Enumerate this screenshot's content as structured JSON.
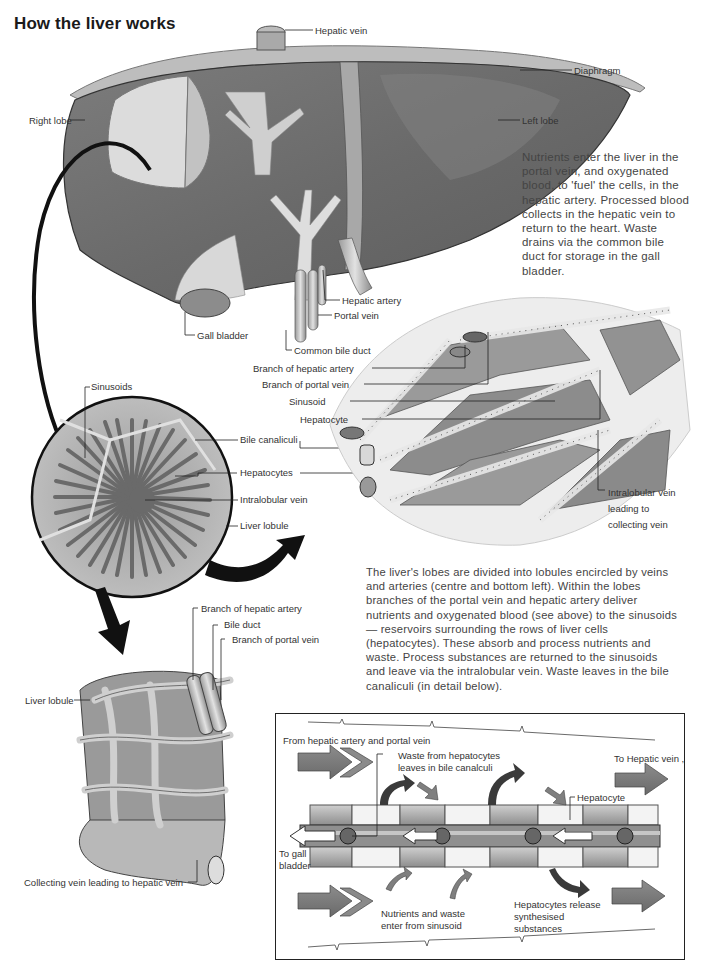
{
  "title": "How the liver works",
  "colors": {
    "liver_dark": "#6b6b6b",
    "liver_mid": "#8a8a8a",
    "liver_light": "#c8c8c8",
    "vessel_light": "#d9d9d9",
    "arrow_black": "#111111",
    "flow_arrow": "#7a7a7a",
    "text": "#333333"
  },
  "liver_labels": {
    "hepatic_vein": "Hepatic vein",
    "diaphragm": "Diaphragm",
    "right_lobe": "Right lobe",
    "left_lobe": "Left lobe",
    "hepatic_artery": "Hepatic artery",
    "portal_vein": "Portal vein",
    "gall_bladder": "Gall bladder",
    "common_bile_duct": "Common bile duct"
  },
  "intro_paragraph": {
    "lines": [
      "Nutrients enter the liver in the",
      "portal vein, and oxygenated",
      "blood, to 'fuel' the cells, in the",
      "hepatic artery. Processed blood",
      "collects in the hepatic vein to",
      "return to the heart. Waste",
      "drains via the common bile",
      "duct for storage in the gall",
      "bladder."
    ]
  },
  "lobule_section_labels": {
    "branch_hepatic_artery": "Branch of hepatic artery",
    "branch_portal_vein": "Branch of portal vein",
    "sinusoid": "Sinusoid",
    "hepatocyte": "Hepatocyte",
    "intralobular_vein_line1": "Intralobular vein",
    "intralobular_vein_line2": "leading to",
    "intralobular_vein_line3": "collecting vein"
  },
  "cross_section_labels": {
    "sinusoids": "Sinusoids",
    "bile_canaliculi": "Bile canaliculi",
    "hepatocytes": "Hepatocytes",
    "intralobular_vein": "Intralobular vein",
    "liver_lobule": "Liver lobule"
  },
  "lobule_paragraph": {
    "lines": [
      "The liver's lobes are divided into lobules encircled by veins",
      "and arteries (centre and bottom left). Within the lobes",
      "branches of the portal vein and hepatic artery deliver",
      "nutrients and oxygenated blood (see above) to the sinusoids",
      "— reservoirs surrounding the rows of liver cells",
      "(hepatocytes). These absorb and process nutrients and",
      "waste. Process substances are returned to the sinusoids",
      "and leave via the intralobular vein. Waste leaves in the bile",
      "canaliculi (in detail below)."
    ]
  },
  "lobule_3d_labels": {
    "branch_hepatic_artery": "Branch of hepatic artery",
    "bile_duct": "Bile duct",
    "branch_portal_vein": "Branch of portal vein",
    "liver_lobule": "Liver lobule",
    "collecting_vein": "Collecting vein leading to hepatic vein"
  },
  "detail_box": {
    "from_hepatic": "From hepatic artery and portal vein",
    "waste_line1": "Waste from hepatocytes",
    "waste_line2": "leaves in bile canalculi",
    "to_hepatic_vein": "To Hepatic vein ,",
    "hepatocyte": "Hepatocyte",
    "to_gall_line1": "To gall",
    "to_gall_line2": "bladder",
    "nutrients_line1": "Nutrients and waste",
    "nutrients_line2": "enter from sinusoid",
    "release_line1": "Hepatocytes release",
    "release_line2": "synthesised",
    "release_line3": "substances"
  }
}
